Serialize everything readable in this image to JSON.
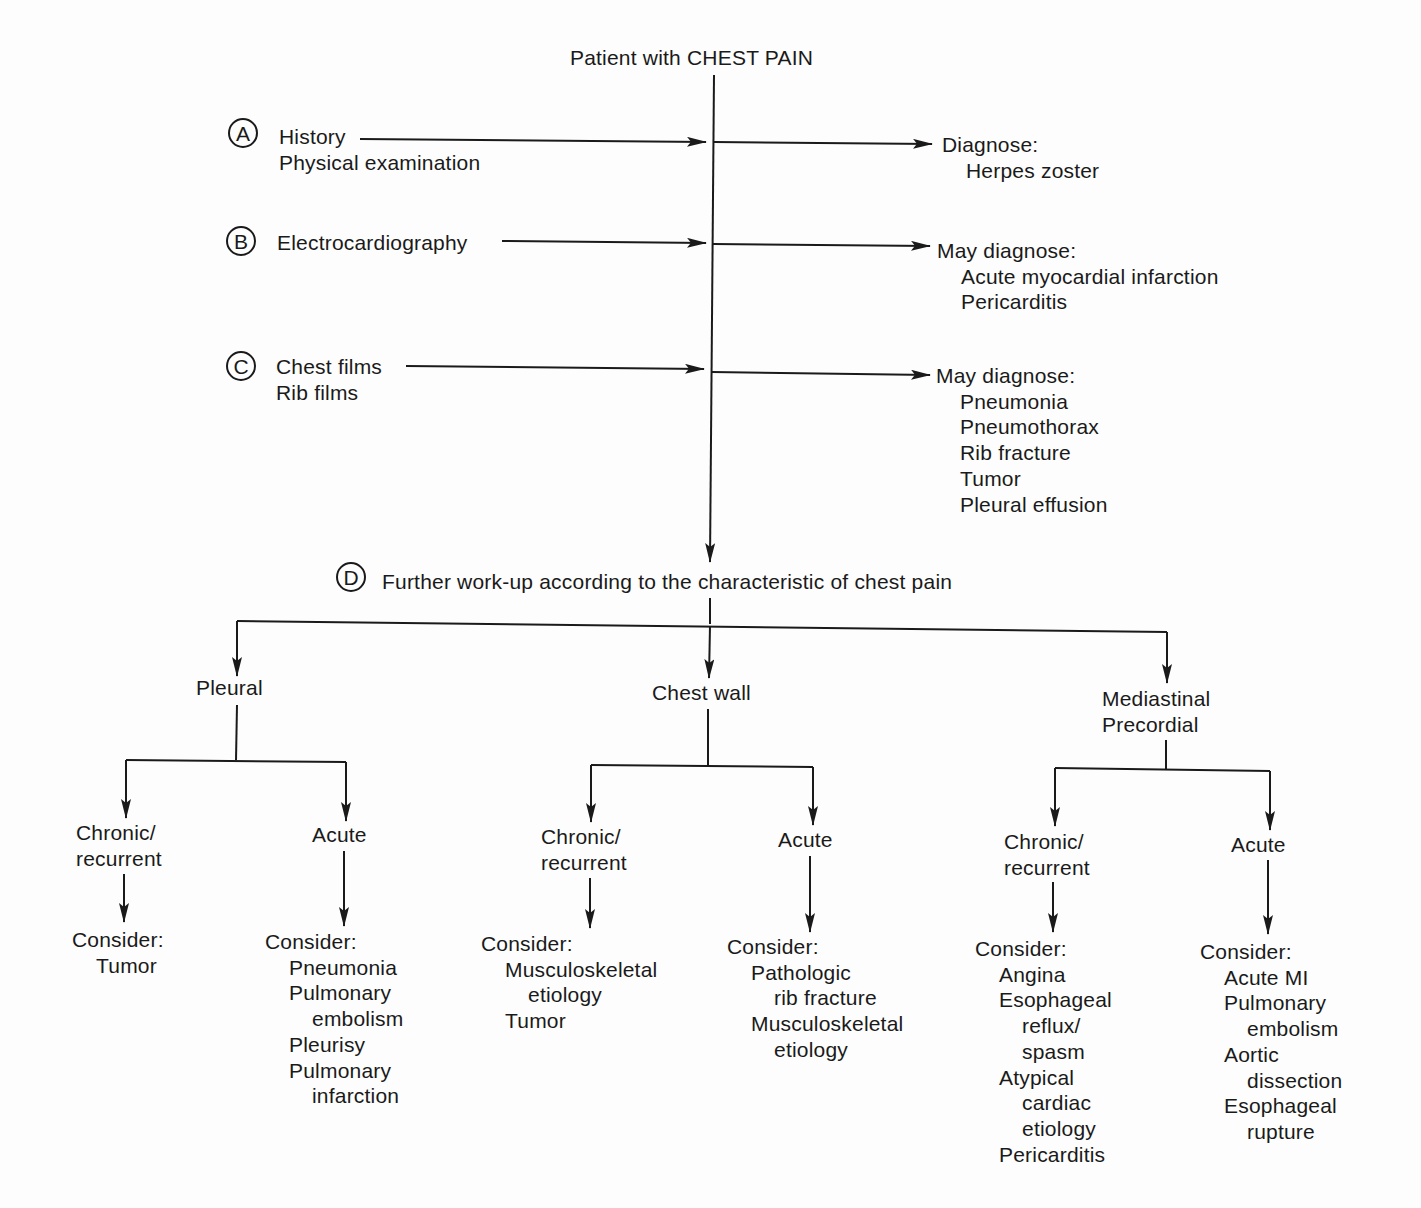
{
  "title": "Patient with CHEST PAIN",
  "steps": {
    "A": {
      "marker": "A",
      "inputs": [
        "History",
        "Physical examination"
      ],
      "outcome_label": "Diagnose:",
      "outcomes": [
        "Herpes zoster"
      ]
    },
    "B": {
      "marker": "B",
      "inputs": [
        "Electrocardiography"
      ],
      "outcome_label": "May diagnose:",
      "outcomes": [
        "Acute myocardial infarction",
        "Pericarditis"
      ]
    },
    "C": {
      "marker": "C",
      "inputs": [
        "Chest films",
        "Rib films"
      ],
      "outcome_label": "May diagnose:",
      "outcomes": [
        "Pneumonia",
        "Pneumothorax",
        "Rib fracture",
        "Tumor",
        "Pleural effusion"
      ]
    },
    "D": {
      "marker": "D",
      "label": "Further work-up according to the characteristic of chest pain"
    }
  },
  "branches": {
    "pleural": {
      "label": "Pleural",
      "chronic": {
        "label_1": "Chronic/",
        "label_2": "recurrent",
        "consider_label": "Consider:",
        "items": [
          "Tumor"
        ]
      },
      "acute": {
        "label": "Acute",
        "consider_label": "Consider:",
        "items": [
          "Pneumonia",
          "Pulmonary",
          "embolism",
          "Pleurisy",
          "Pulmonary",
          "infarction"
        ]
      }
    },
    "chest_wall": {
      "label": "Chest wall",
      "chronic": {
        "label_1": "Chronic/",
        "label_2": "recurrent",
        "consider_label": "Consider:",
        "items": [
          "Musculoskeletal",
          "etiology",
          "Tumor"
        ]
      },
      "acute": {
        "label": "Acute",
        "consider_label": "Consider:",
        "items": [
          "Pathologic",
          "rib fracture",
          "Musculoskeletal",
          "etiology"
        ]
      }
    },
    "mediastinal": {
      "label_1": "Mediastinal",
      "label_2": "Precordial",
      "chronic": {
        "label_1": "Chronic/",
        "label_2": "recurrent",
        "consider_label": "Consider:",
        "items": [
          "Angina",
          "Esophageal",
          "reflux/",
          "spasm",
          "Atypical",
          "cardiac",
          "etiology",
          "Pericarditis"
        ]
      },
      "acute": {
        "label": "Acute",
        "consider_label": "Consider:",
        "items": [
          "Acute MI",
          "Pulmonary",
          "embolism",
          "Aortic",
          "dissection",
          "Esophageal",
          "rupture"
        ]
      }
    }
  },
  "colors": {
    "ink": "#1a1a1a",
    "paper": "#fdfdfd"
  }
}
